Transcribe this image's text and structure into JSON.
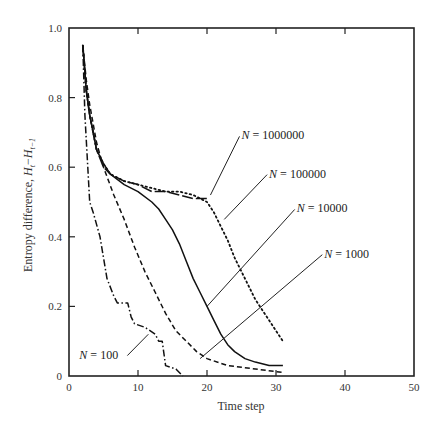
{
  "chart_data": {
    "type": "line",
    "title": "",
    "xlabel": "Time step",
    "ylabel": "Entropy difference, H_t − H_{t−1}",
    "ylabel_parts": {
      "prefix": "Entropy difference, ",
      "h1": "H",
      "s1": "t",
      "minus": "−",
      "h2": "H",
      "s2": "t−1"
    },
    "xlim": [
      0,
      50
    ],
    "ylim": [
      0,
      1.0
    ],
    "x_ticks": [
      0,
      10,
      20,
      30,
      40,
      50
    ],
    "x_tick_labels": [
      "0",
      "10",
      "20",
      "30",
      "40",
      "50"
    ],
    "y_ticks": [
      0,
      0.2,
      0.4,
      0.6,
      0.8,
      1.0
    ],
    "y_tick_labels": [
      "0",
      "0.2",
      "0.4",
      "0.6",
      "0.8",
      "1.0"
    ],
    "grid": false,
    "legend": "inline annotations",
    "series": [
      {
        "name": "N = 100",
        "style": "dash-dot",
        "x": [
          2,
          2.3,
          3,
          3.5,
          4.5,
          5.5,
          6.5,
          7,
          8.5,
          9,
          9.5,
          11,
          12.5,
          13,
          13.5,
          14,
          15.5,
          16.5
        ],
        "values": [
          0.95,
          0.75,
          0.5,
          0.47,
          0.4,
          0.28,
          0.23,
          0.21,
          0.21,
          0.17,
          0.15,
          0.14,
          0.12,
          0.1,
          0.1,
          0.03,
          0.02,
          0.0
        ]
      },
      {
        "name": "N = 1000",
        "style": "dashed",
        "x": [
          2,
          2.5,
          3,
          4,
          5,
          6.5,
          8,
          9.5,
          11,
          12.5,
          14,
          15.5,
          17,
          18.5,
          20,
          23,
          27,
          31
        ],
        "values": [
          0.95,
          0.85,
          0.78,
          0.67,
          0.6,
          0.52,
          0.45,
          0.37,
          0.3,
          0.24,
          0.18,
          0.13,
          0.1,
          0.07,
          0.05,
          0.03,
          0.02,
          0.01
        ]
      },
      {
        "name": "N = 10000",
        "style": "solid",
        "x": [
          2,
          2.5,
          3,
          4,
          5,
          6,
          8,
          10,
          12,
          13,
          14,
          15,
          16,
          17,
          18,
          19,
          20,
          21,
          22,
          23,
          24,
          25.5,
          27,
          29,
          31
        ],
        "values": [
          0.95,
          0.82,
          0.75,
          0.65,
          0.61,
          0.58,
          0.55,
          0.53,
          0.5,
          0.48,
          0.45,
          0.42,
          0.38,
          0.33,
          0.28,
          0.24,
          0.2,
          0.16,
          0.12,
          0.09,
          0.07,
          0.05,
          0.04,
          0.03,
          0.03
        ]
      },
      {
        "name": "N = 100000",
        "style": "dotted",
        "x": [
          2,
          2.5,
          3,
          4,
          5,
          6,
          8,
          10,
          12,
          14,
          16,
          18,
          19,
          20,
          21,
          22,
          23,
          24,
          25,
          26,
          27,
          28,
          29,
          30,
          31
        ],
        "values": [
          0.95,
          0.82,
          0.75,
          0.65,
          0.61,
          0.58,
          0.56,
          0.55,
          0.54,
          0.53,
          0.53,
          0.52,
          0.51,
          0.5,
          0.47,
          0.43,
          0.39,
          0.34,
          0.3,
          0.26,
          0.22,
          0.19,
          0.16,
          0.13,
          0.1
        ]
      },
      {
        "name": "N = 1000000",
        "style": "long-dash",
        "x": [
          2,
          2.5,
          3,
          4,
          5,
          6,
          8,
          10,
          12,
          14,
          16,
          18,
          20
        ],
        "values": [
          0.95,
          0.82,
          0.75,
          0.65,
          0.6,
          0.58,
          0.56,
          0.55,
          0.53,
          0.53,
          0.52,
          0.51,
          0.51
        ]
      }
    ],
    "annotations": [
      {
        "text": "N = 1000000",
        "label_italic": "N",
        "label_rest": " = 1000000",
        "at": [
          25,
          0.68
        ],
        "pointer_to": [
          20.5,
          0.52
        ]
      },
      {
        "text": "N = 100000",
        "label_italic": "N",
        "label_rest": " = 100000",
        "at": [
          29,
          0.57
        ],
        "pointer_to": [
          22.5,
          0.45
        ]
      },
      {
        "text": "N = 10000",
        "label_italic": "N",
        "label_rest": " = 10000",
        "at": [
          33,
          0.47
        ],
        "pointer_to": [
          20,
          0.2
        ]
      },
      {
        "text": "N = 1000",
        "label_italic": "N",
        "label_rest": " = 1000",
        "at": [
          37,
          0.34
        ],
        "pointer_to": [
          19,
          0.05
        ]
      },
      {
        "text": "N = 100",
        "label_italic": "N",
        "label_rest": " = 100",
        "at": [
          1.5,
          0.05
        ],
        "pointer_to": [
          11.5,
          0.12
        ]
      }
    ]
  }
}
